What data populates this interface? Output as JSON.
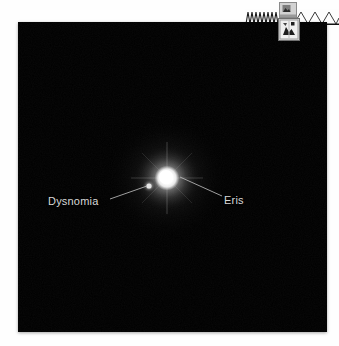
{
  "document": {
    "background_color": "#ffffff",
    "width": 339,
    "height": 346
  },
  "header": {
    "decoration_name": "zigzag-band",
    "broken_image_icons": [
      {
        "name": "broken-image-icon-small",
        "alt": ""
      },
      {
        "name": "broken-image-icon",
        "alt": ""
      }
    ]
  },
  "figure": {
    "name": "eris-dysnomia-telescope-image",
    "background_color": "#000000",
    "objects": [
      {
        "id": "eris",
        "label": "Eris",
        "type": "dwarf-planet",
        "brightness": "bright",
        "color": "#ffffff",
        "x": 167,
        "y": 178
      },
      {
        "id": "dysnomia",
        "label": "Dysnomia",
        "type": "moon",
        "brightness": "faint",
        "color": "#cfcfcf",
        "x": 149,
        "y": 186
      }
    ],
    "leader_lines": [
      {
        "from_label": "Dysnomia",
        "x1": 110,
        "y1": 199,
        "x2": 147,
        "y2": 186
      },
      {
        "from_label": "Eris",
        "x1": 180,
        "y1": 177,
        "x2": 222,
        "y2": 196
      }
    ],
    "label_color": "#d8d8d8"
  }
}
